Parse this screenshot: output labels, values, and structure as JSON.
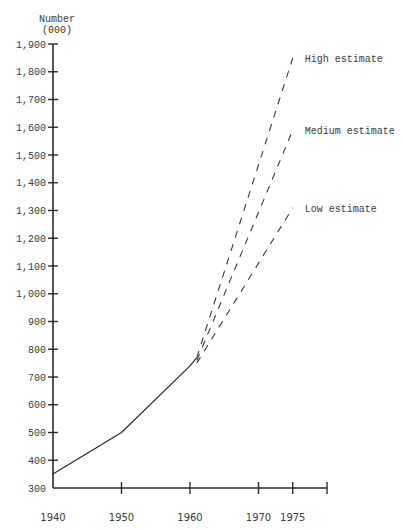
{
  "chart_data": {
    "type": "line",
    "title": "",
    "ylabel": "Number (000)",
    "ylabel_lines": [
      "Number",
      "(000)"
    ],
    "xlabel": "",
    "ylim": [
      300,
      1900
    ],
    "xlim": [
      1940,
      1980
    ],
    "grid": false,
    "legend": "none (series labelled inline at line ends)",
    "y_ticks": [
      300,
      400,
      500,
      600,
      700,
      800,
      900,
      1000,
      1100,
      1200,
      1300,
      1400,
      1500,
      1600,
      1700,
      1800,
      1900
    ],
    "y_tick_labels": [
      "300",
      "400",
      "500",
      "600",
      "700",
      "800",
      "900",
      "1,000",
      "1,100",
      "1,200",
      "1,300",
      "1,400",
      "1,500",
      "1,600",
      "1,700",
      "1,800",
      "1,900"
    ],
    "x_ticks": [
      1940,
      1950,
      1960,
      1970,
      1975,
      1980
    ],
    "x_tick_labels": [
      "1940",
      "1950",
      "1960",
      "1970",
      "1975",
      ""
    ],
    "series": [
      {
        "name": "Actual",
        "style": "solid",
        "x": [
          1940,
          1950,
          1960,
          1961
        ],
        "values": [
          350,
          500,
          740,
          770
        ]
      },
      {
        "name": "High estimate",
        "style": "dashed",
        "x": [
          1961,
          1975
        ],
        "values": [
          770,
          1850
        ]
      },
      {
        "name": "Medium estimate",
        "style": "dashed",
        "x": [
          1961,
          1975
        ],
        "values": [
          760,
          1590
        ]
      },
      {
        "name": "Low estimate",
        "style": "dashed",
        "x": [
          1961,
          1975
        ],
        "values": [
          750,
          1310
        ]
      }
    ],
    "annotations": [
      "High estimate",
      "Medium estimate",
      "Low estimate"
    ]
  },
  "colors": {
    "background": "#ffffff",
    "ink": "#2b2b2b"
  }
}
